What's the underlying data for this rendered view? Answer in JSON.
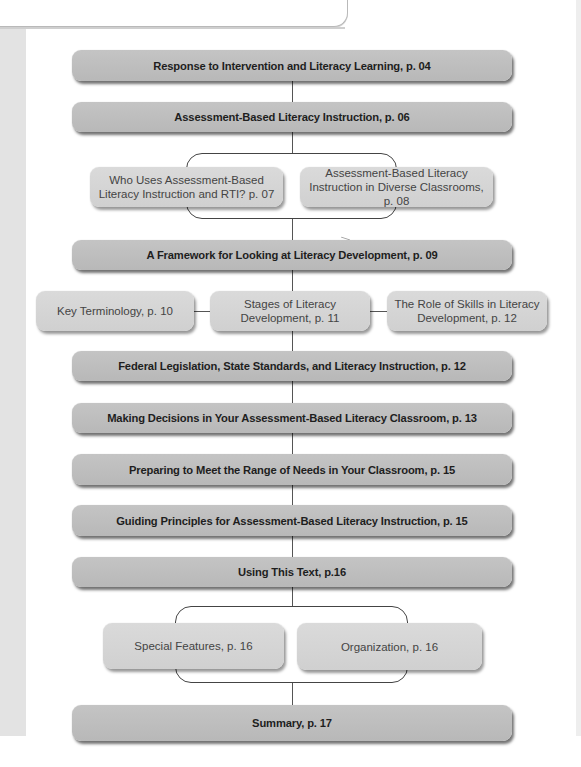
{
  "diagram": {
    "main_nodes": [
      {
        "id": "n1",
        "label": "Response to Intervention and Literacy Learning, p. 04"
      },
      {
        "id": "n2",
        "label": "Assessment-Based Literacy Instruction, p. 06"
      },
      {
        "id": "n3",
        "label": "A Framework for Looking at Literacy Development, p. 09"
      },
      {
        "id": "n4",
        "label": "Federal Legislation, State Standards, and Literacy Instruction, p. 12"
      },
      {
        "id": "n5",
        "label": "Making Decisions in Your Assessment-Based Literacy Classroom, p. 13"
      },
      {
        "id": "n6",
        "label": "Preparing to Meet the Range of Needs in Your Classroom, p. 15"
      },
      {
        "id": "n7",
        "label": "Guiding Principles for Assessment-Based Literacy Instruction, p. 15"
      },
      {
        "id": "n8",
        "label": "Using This Text, p.16"
      },
      {
        "id": "n9",
        "label": "Summary, p. 17"
      }
    ],
    "sub_groups": {
      "abli": [
        {
          "label": "Who Uses Assessment-Based Literacy Instruction and RTI? p. 07"
        },
        {
          "label": "Assessment-Based Literacy Instruction in Diverse Classrooms, p. 08"
        }
      ],
      "framework": [
        {
          "label": "Key Terminology, p. 10"
        },
        {
          "label": "Stages of Literacy Development, p. 11"
        },
        {
          "label": "The Role of Skills in Literacy Development, p. 12"
        }
      ],
      "using_text": [
        {
          "label": "Special Features, p. 16"
        },
        {
          "label": "Organization, p. 16"
        }
      ]
    },
    "colors": {
      "primary_box": "#bdbdbd",
      "secondary_box": "#d4d4d4",
      "connector": "#555555",
      "text": "#1e1e1e"
    }
  }
}
